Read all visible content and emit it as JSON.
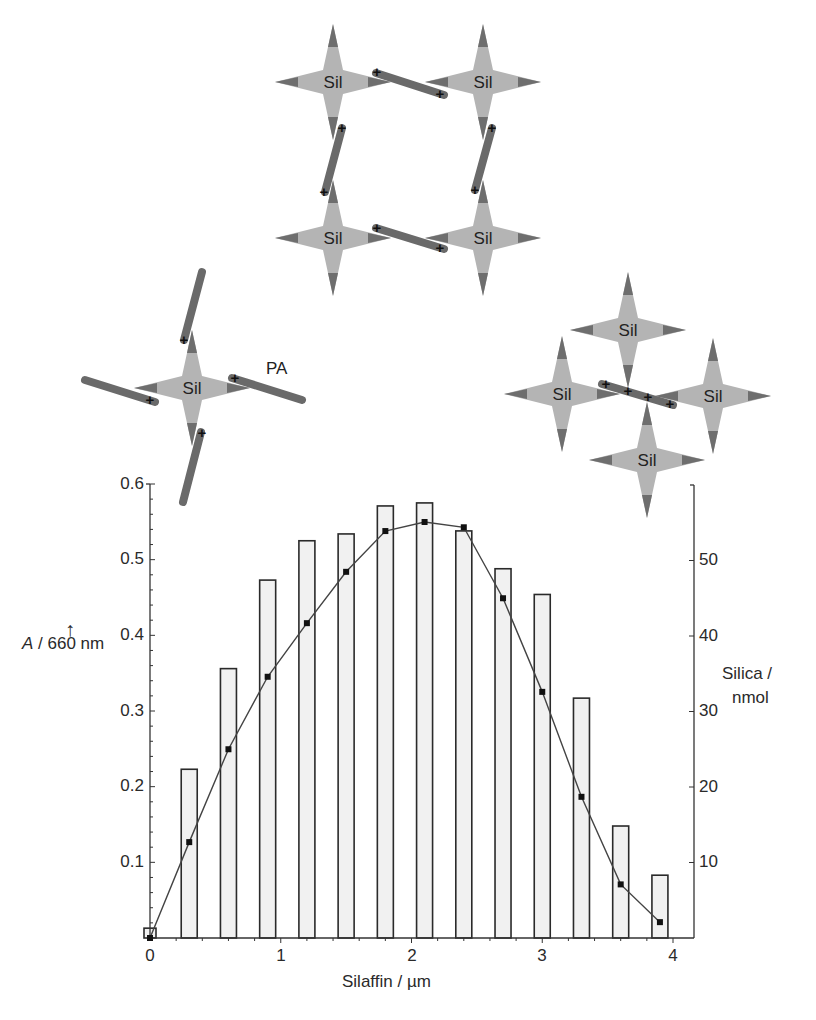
{
  "diagram": {
    "node_label": "Sil",
    "charge_label": "+",
    "pa_label": "PA",
    "colors": {
      "star_fill": "#b4b4b4",
      "star_tip": "#6e6e6e",
      "rod": "#6a6a6a"
    }
  },
  "axes": {
    "left_label_italic": "A",
    "left_label_rest": " / 660 nm",
    "left_arrow": "↑",
    "right_label_line1": "Silica /",
    "right_label_line2": "nmol",
    "x_label": "Silaffin / µm",
    "left_ticks": [
      "0.6",
      "0.5",
      "0.4",
      "0.3",
      "0.2",
      "0.1"
    ],
    "right_ticks": [
      "50",
      "40",
      "30",
      "20",
      "10"
    ],
    "x_ticks": [
      "0",
      "1",
      "2",
      "3",
      "4"
    ]
  },
  "chart_data": {
    "type": "bar",
    "title": "",
    "xlabel": "Silaffin / µm",
    "ylabel": "A / 660 nm",
    "y2label": "Silica / nmol",
    "xlim": [
      0,
      4
    ],
    "ylim": [
      0,
      0.6
    ],
    "y2lim": [
      0,
      60
    ],
    "grid": false,
    "legend": "none",
    "x": [
      0,
      0.3,
      0.6,
      0.9,
      1.2,
      1.5,
      1.8,
      2.1,
      2.4,
      2.7,
      3.0,
      3.3,
      3.6,
      3.9
    ],
    "series": [
      {
        "name": "A / 660 nm",
        "type": "bar",
        "axis": "left",
        "values": [
          0.013,
          0.223,
          0.356,
          0.473,
          0.525,
          0.534,
          0.571,
          0.575,
          0.538,
          0.488,
          0.454,
          0.317,
          0.148,
          0.083
        ]
      },
      {
        "name": "Silica / nmol",
        "type": "line",
        "axis": "right",
        "values": [
          0,
          12.7,
          25.0,
          34.6,
          41.7,
          48.5,
          53.9,
          55.1,
          54.4,
          45.0,
          32.6,
          18.7,
          7.1,
          2.1
        ]
      }
    ]
  }
}
